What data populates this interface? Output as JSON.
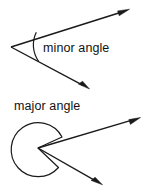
{
  "figure": {
    "background_color": "#ffffff",
    "stroke_color": "#1a1a1a",
    "text_color": "#111111"
  },
  "minor": {
    "label": "minor angle",
    "vertex": {
      "x": 11,
      "y": 47
    },
    "ray_upper_tip": {
      "x": 128,
      "y": 10
    },
    "ray_lower_tip": {
      "x": 88,
      "y": 88
    },
    "arc_start": {
      "x": 36,
      "y": 32
    },
    "arc_end": {
      "x": 39,
      "y": 61
    },
    "label_position": {
      "x": 43,
      "y": 51
    }
  },
  "major": {
    "label": "major angle",
    "vertex": {
      "x": 38,
      "y": 148
    },
    "ray_upper_tip": {
      "x": 139,
      "y": 118
    },
    "ray_lower_tip": {
      "x": 101,
      "y": 184
    },
    "circle_center": {
      "x": 33,
      "y": 149
    },
    "circle_radius": 27,
    "label_position": {
      "x": 14,
      "y": 110
    }
  }
}
